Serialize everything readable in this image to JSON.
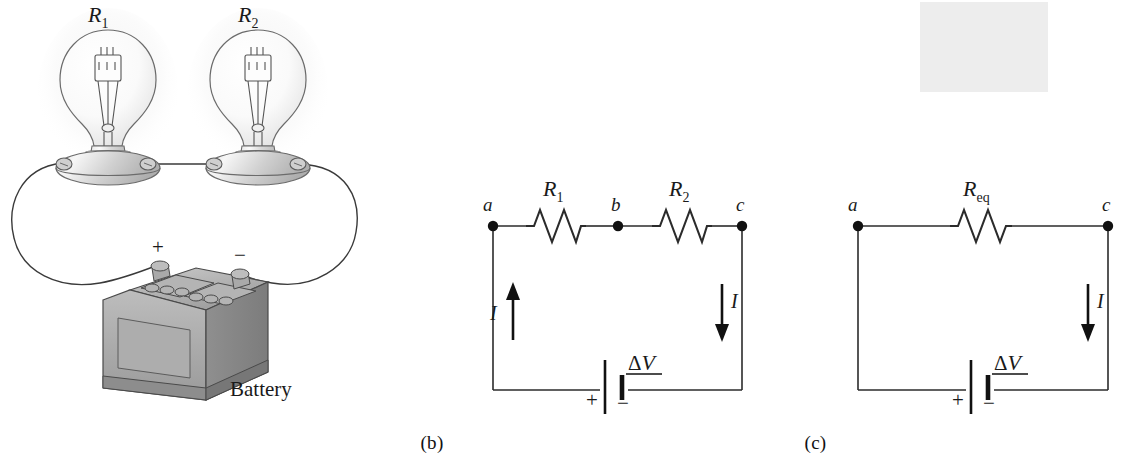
{
  "figure": {
    "background_color": "#ffffff",
    "line_color": "#1a1a1a",
    "highlight_color": "#e8e8e8"
  },
  "panels": [
    {
      "id": "a",
      "caption": "(a)",
      "description": "Two light bulbs connected in series to a battery",
      "labels": {
        "bulb1": "R",
        "bulb1_sub": "1",
        "bulb2": "R",
        "bulb2_sub": "2",
        "battery": "Battery",
        "plus": "+",
        "minus": "−"
      }
    },
    {
      "id": "b",
      "caption": "(b)",
      "description": "Circuit diagram with two resistors in series between nodes a, b and c",
      "labels": {
        "node_a": "a",
        "node_b": "b",
        "node_c": "c",
        "resistor1": "R",
        "resistor1_sub": "1",
        "resistor2": "R",
        "resistor2_sub": "2",
        "current_left": "I",
        "current_right": "I",
        "source_delta": "Δ",
        "source_v": "V",
        "source_plus": "+",
        "source_minus": "−"
      }
    },
    {
      "id": "c",
      "caption": "(c)",
      "description": "Equivalent circuit with a single equivalent resistance highlighted",
      "labels": {
        "node_a": "a",
        "node_c": "c",
        "resistor_eq": "R",
        "resistor_eq_sub": "eq",
        "current_right": "I",
        "source_delta": "Δ",
        "source_v": "V",
        "source_plus": "+",
        "source_minus": "−"
      }
    }
  ]
}
